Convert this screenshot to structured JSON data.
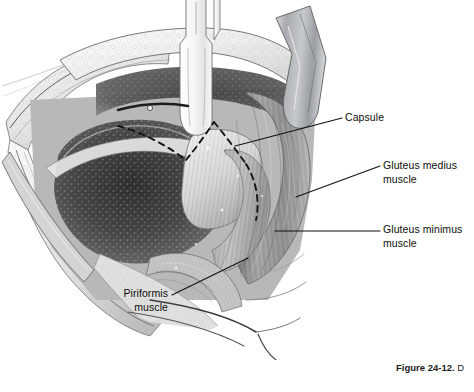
{
  "figure": {
    "alt_description": "Grayscale surgical illustration of a posterior hip exposure showing retractors, the hip joint capsule with dashed capsulotomy incision markings, and the gluteal musculature",
    "background_color": "#ffffff"
  },
  "labels": [
    {
      "id": "capsule",
      "text": "Capsule",
      "lines": [
        "Capsule"
      ],
      "align": "left"
    },
    {
      "id": "gluteus-medius",
      "text": "Gluteus medius muscle",
      "lines": [
        "Gluteus medius",
        "muscle"
      ],
      "align": "left"
    },
    {
      "id": "gluteus-minimus",
      "text": "Gluteus minimus muscle",
      "lines": [
        "Gluteus minimus",
        "muscle"
      ],
      "align": "left"
    },
    {
      "id": "piriformis",
      "text": "Piriformis muscle",
      "lines": [
        "Piriformis",
        "muscle"
      ],
      "align": "right"
    }
  ],
  "label_text": {
    "capsule": "Capsule",
    "gluteus_medius": "Gluteus medius\nmuscle",
    "gluteus_minimus": "Gluteus minimus\nmuscle",
    "piriformis": "Piriformis\nmuscle"
  },
  "caption": {
    "figure_number": "Figure 24-12.",
    "text_fragment": " D",
    "clipped": true
  },
  "colors": {
    "background": "#ffffff",
    "label_text": "#0d0d0d",
    "leader_line": "#111111",
    "dashed_incision": "#141414",
    "retractor_metal": "#b9bcc0",
    "retractor_pale": "#f2f2f0",
    "deep_tissue_dark": "#4a4a4a",
    "muscle_mid_gray": "#9a9a9a",
    "fat_light": "#e8e8e6"
  }
}
